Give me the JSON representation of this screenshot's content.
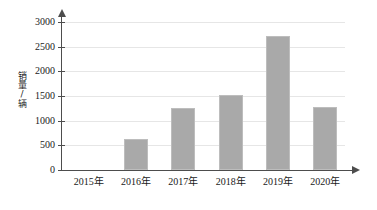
{
  "chart_data": {
    "type": "bar",
    "title": "",
    "subtitle": "",
    "xlabel": "",
    "ylabel": "销量/辆",
    "categories": [
      "2015年",
      "2016年",
      "2017年",
      "2018年",
      "2019年",
      "2020年"
    ],
    "values": [
      0,
      620,
      1260,
      1530,
      2720,
      1280
    ],
    "series": [
      {
        "name": "销量",
        "values": [
          0,
          620,
          1260,
          1530,
          2720,
          1280
        ]
      }
    ],
    "ylim": [
      0,
      3000
    ],
    "ytick_step": 500,
    "ytick_labels": [
      "0",
      "500",
      "1000",
      "1500",
      "2000",
      "2500",
      "3000"
    ],
    "ytick_values": [
      0,
      500,
      1000,
      1500,
      2000,
      2500,
      3000
    ],
    "grid": true,
    "grid_axis": "y",
    "legend": false,
    "legend_position": "none",
    "bar_color": "#a9a9a9",
    "axis_color": "#4d4d4d",
    "gridline_color": "#e6e6e6",
    "background_color": "#ffffff",
    "annotations": []
  },
  "axes": {
    "y_title": "销量/辆",
    "y_arrow_icon": "arrow-up-icon",
    "x_arrow_icon": "arrow-right-icon"
  }
}
